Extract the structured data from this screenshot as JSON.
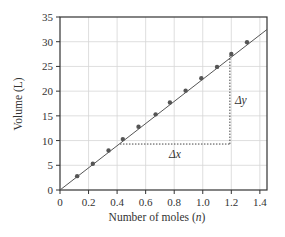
{
  "chart_data": {
    "type": "scatter",
    "title": "",
    "xlabel": "Number of moles (n)",
    "ylabel": "Volume (L)",
    "xlim": [
      0,
      1.45
    ],
    "ylim": [
      0,
      35
    ],
    "x_ticks": [
      "0",
      "0.2",
      "0.4",
      "0.6",
      "0.8",
      "1.0",
      "1.2",
      "1.4"
    ],
    "y_ticks": [
      "0",
      "5",
      "10",
      "15",
      "20",
      "25",
      "30",
      "35"
    ],
    "grid": true,
    "series": [
      {
        "name": "data points",
        "x": [
          0.12,
          0.23,
          0.34,
          0.44,
          0.55,
          0.67,
          0.77,
          0.88,
          0.99,
          1.1,
          1.2,
          1.31
        ],
        "y": [
          2.8,
          5.3,
          8.0,
          10.3,
          12.8,
          15.3,
          17.7,
          20.1,
          22.6,
          24.9,
          27.5,
          29.9
        ]
      }
    ],
    "fit_line": {
      "slope": 22.4,
      "intercept": 0,
      "x_range": [
        0,
        1.45
      ]
    },
    "annotations": [
      {
        "text": "Δx",
        "type": "dotted-horizontal",
        "from": [
          0.42,
          9.3
        ],
        "to": [
          1.19,
          9.3
        ]
      },
      {
        "text": "Δy",
        "type": "dotted-vertical",
        "from": [
          1.19,
          9.3
        ],
        "to": [
          1.19,
          27.3
        ]
      }
    ]
  },
  "labels": {
    "xlabel_prefix": "Number of moles (",
    "xlabel_var": "n",
    "xlabel_suffix": ")",
    "ylabel": "Volume (L)",
    "delta_x": "Δx",
    "delta_y": "Δy"
  }
}
